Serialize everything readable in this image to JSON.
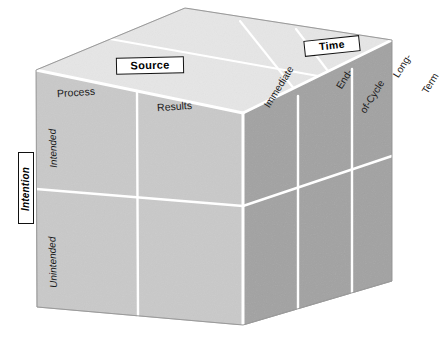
{
  "diagram": {
    "type": "3d-cube-matrix"
  },
  "axes": {
    "source": {
      "label": "Source"
    },
    "time": {
      "label": "Time"
    },
    "intention": {
      "label": "Intention"
    }
  },
  "front_face": {
    "columns": [
      {
        "label": "Process"
      },
      {
        "label": "Results"
      }
    ],
    "rows": [
      {
        "label": "Intended"
      },
      {
        "label": "Unintended"
      }
    ]
  },
  "right_face": {
    "columns": [
      {
        "label": "Immediate",
        "lines": [
          "Immediate"
        ]
      },
      {
        "label": "End-of-Cycle",
        "lines": [
          "End-",
          "of-Cycle"
        ]
      },
      {
        "label": "Long-Term",
        "lines": [
          "Long-",
          "Term"
        ]
      }
    ]
  },
  "colors": {
    "front_face": "#c9c9c9",
    "right_face": "#a2a2a2",
    "top_face": "#e6e6e6",
    "edge": "#ffffff",
    "outline": "#9a9a9a",
    "text": "#1a1a1a",
    "box_border": "#111111",
    "box_fill": "#ffffff",
    "background": "#ffffff"
  }
}
